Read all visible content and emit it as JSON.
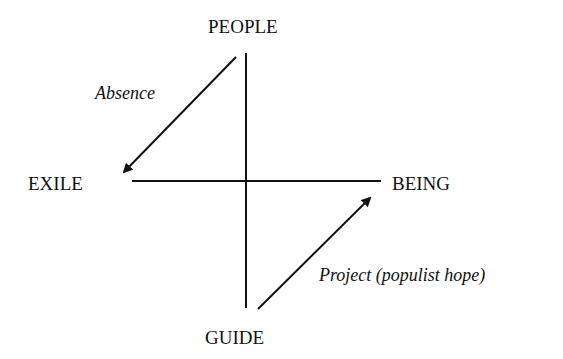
{
  "diagram": {
    "nodes": {
      "top": "PEOPLE",
      "left": "EXILE",
      "right": "BEING",
      "bottom": "GUIDE"
    },
    "edges": [
      {
        "from": "PEOPLE",
        "to": "EXILE",
        "label": "Absence"
      },
      {
        "from": "GUIDE",
        "to": "BEING",
        "label": "Project (populist hope)"
      }
    ],
    "colors": {
      "ink": "#111111",
      "background": "#ffffff"
    }
  }
}
